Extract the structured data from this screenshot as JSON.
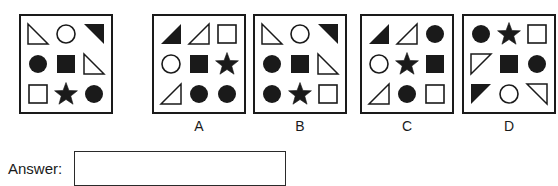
{
  "question": {
    "panel_label": "",
    "cells": [
      {
        "shape": "triangle",
        "fill": "outline",
        "corner": "bottom-left"
      },
      {
        "shape": "circle",
        "fill": "outline"
      },
      {
        "shape": "triangle",
        "fill": "solid",
        "corner": "top-right"
      },
      {
        "shape": "circle",
        "fill": "solid"
      },
      {
        "shape": "square",
        "fill": "solid"
      },
      {
        "shape": "triangle",
        "fill": "outline",
        "corner": "bottom-left"
      },
      {
        "shape": "square",
        "fill": "outline"
      },
      {
        "shape": "star",
        "fill": "solid"
      },
      {
        "shape": "circle",
        "fill": "solid"
      }
    ]
  },
  "options": [
    {
      "label": "A",
      "cells": [
        {
          "shape": "triangle",
          "fill": "solid",
          "corner": "bottom-right"
        },
        {
          "shape": "triangle",
          "fill": "outline",
          "corner": "bottom-right"
        },
        {
          "shape": "square",
          "fill": "outline"
        },
        {
          "shape": "circle",
          "fill": "outline"
        },
        {
          "shape": "square",
          "fill": "solid"
        },
        {
          "shape": "star",
          "fill": "solid"
        },
        {
          "shape": "triangle",
          "fill": "outline",
          "corner": "bottom-right"
        },
        {
          "shape": "circle",
          "fill": "solid"
        },
        {
          "shape": "circle",
          "fill": "solid"
        }
      ]
    },
    {
      "label": "B",
      "cells": [
        {
          "shape": "triangle",
          "fill": "outline",
          "corner": "bottom-left"
        },
        {
          "shape": "circle",
          "fill": "outline"
        },
        {
          "shape": "triangle",
          "fill": "solid",
          "corner": "top-right"
        },
        {
          "shape": "circle",
          "fill": "solid"
        },
        {
          "shape": "square",
          "fill": "solid"
        },
        {
          "shape": "triangle",
          "fill": "outline",
          "corner": "bottom-left"
        },
        {
          "shape": "circle",
          "fill": "solid"
        },
        {
          "shape": "star",
          "fill": "solid"
        },
        {
          "shape": "square",
          "fill": "outline"
        }
      ]
    },
    {
      "label": "C",
      "cells": [
        {
          "shape": "triangle",
          "fill": "solid",
          "corner": "bottom-right"
        },
        {
          "shape": "triangle",
          "fill": "outline",
          "corner": "bottom-right"
        },
        {
          "shape": "circle",
          "fill": "solid"
        },
        {
          "shape": "circle",
          "fill": "outline"
        },
        {
          "shape": "star",
          "fill": "solid"
        },
        {
          "shape": "square",
          "fill": "solid"
        },
        {
          "shape": "triangle",
          "fill": "outline",
          "corner": "bottom-right"
        },
        {
          "shape": "circle",
          "fill": "solid"
        },
        {
          "shape": "square",
          "fill": "outline"
        }
      ]
    },
    {
      "label": "D",
      "cells": [
        {
          "shape": "circle",
          "fill": "solid"
        },
        {
          "shape": "star",
          "fill": "solid"
        },
        {
          "shape": "square",
          "fill": "outline"
        },
        {
          "shape": "triangle",
          "fill": "outline",
          "corner": "top-left"
        },
        {
          "shape": "square",
          "fill": "solid"
        },
        {
          "shape": "circle",
          "fill": "solid"
        },
        {
          "shape": "triangle",
          "fill": "solid",
          "corner": "top-left"
        },
        {
          "shape": "circle",
          "fill": "outline"
        },
        {
          "shape": "triangle",
          "fill": "outline",
          "corner": "top-right"
        }
      ]
    }
  ],
  "answer": {
    "label": "Answer:",
    "value": "",
    "placeholder": ""
  },
  "colors": {
    "ink": "#1a1a1a",
    "background": "#ffffff",
    "box_border": "#2a2a2a"
  }
}
